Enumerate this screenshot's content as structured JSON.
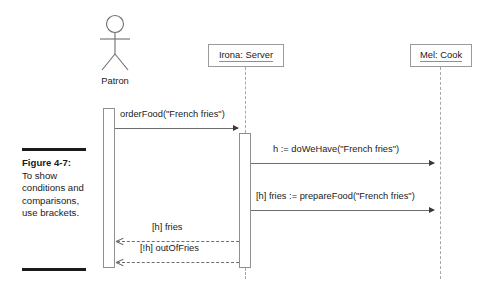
{
  "figure": {
    "number_label": "Figure 4-7:",
    "caption_text": "To show conditions and comparisons, use brackets."
  },
  "diagram": {
    "type": "uml-sequence-diagram",
    "colors": {
      "rule": "#1a1a1a",
      "box_border": "#9a9a9a",
      "lifeline": "#a8a8a8",
      "message": "#6e6e6e",
      "text": "#1a1a1a"
    },
    "participants": [
      {
        "id": "patron",
        "label": "Patron",
        "kind": "actor"
      },
      {
        "id": "irona",
        "label": "Irona: Server",
        "kind": "object"
      },
      {
        "id": "mel",
        "label": "Mel: Cook",
        "kind": "object"
      }
    ],
    "messages": [
      {
        "index": 1,
        "label": "orderFood(\"French fries\")",
        "from": "patron",
        "to": "irona",
        "kind": "synchronous",
        "style": "solid",
        "arrowhead": "filled",
        "direction": "right"
      },
      {
        "index": 2,
        "label": "h := doWeHave(\"French fries\")",
        "from": "irona",
        "to": "mel",
        "kind": "synchronous",
        "style": "solid",
        "arrowhead": "filled",
        "direction": "right"
      },
      {
        "index": 3,
        "label": "[h] fries := prepareFood(\"French fries\")",
        "from": "irona",
        "to": "mel",
        "kind": "synchronous",
        "style": "solid",
        "arrowhead": "filled",
        "direction": "right",
        "guard": "[h]"
      },
      {
        "index": 4,
        "label": "[h] fries",
        "from": "irona",
        "to": "patron",
        "kind": "return",
        "style": "dashed",
        "arrowhead": "open",
        "direction": "left",
        "guard": "[h]"
      },
      {
        "index": 5,
        "label": "[!h] outOfFries",
        "from": "irona",
        "to": "patron",
        "kind": "return",
        "style": "dashed",
        "arrowhead": "open",
        "direction": "left",
        "guard": "[!h]"
      }
    ]
  }
}
